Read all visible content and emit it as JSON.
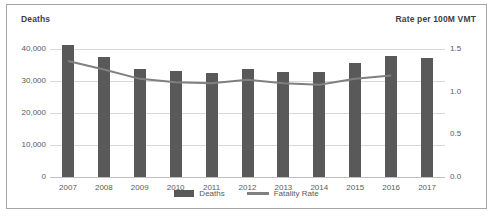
{
  "chart_data": {
    "type": "bar",
    "title": "",
    "xlabel": "",
    "ylabel": "Deaths",
    "y2label": "Rate per 100M VMT",
    "categories": [
      "2007",
      "2008",
      "2009",
      "2010",
      "2011",
      "2012",
      "2013",
      "2014",
      "2015",
      "2016",
      "2017"
    ],
    "ylim": [
      0,
      40000
    ],
    "y2lim": [
      0.0,
      1.5
    ],
    "grid": true,
    "legend_position": "bottom",
    "yticks": [
      "0",
      "10,000",
      "20,000",
      "30,000",
      "40,000"
    ],
    "ytick_values": [
      0,
      10000,
      20000,
      30000,
      40000
    ],
    "y2ticks": [
      "0.0",
      "0.5",
      "1.0",
      "1.5"
    ],
    "y2tick_values": [
      0.0,
      0.5,
      1.0,
      1.5
    ],
    "series": [
      {
        "name": "Deaths",
        "axis": "left",
        "kind": "bar",
        "color": "#595959",
        "values": [
          41259,
          37423,
          33883,
          32999,
          32479,
          33782,
          32893,
          32744,
          35485,
          37806,
          37133
        ]
      },
      {
        "name": "Fatality Rate",
        "axis": "right",
        "kind": "line",
        "color": "#808080",
        "values": [
          1.36,
          1.26,
          1.15,
          1.11,
          1.1,
          1.14,
          1.1,
          1.08,
          1.15,
          1.19,
          null
        ]
      }
    ],
    "legend": [
      {
        "label": "Deaths",
        "marker": "bar",
        "color": "#595959"
      },
      {
        "label": "Fatality Rate",
        "marker": "line",
        "color": "#808080"
      }
    ]
  }
}
